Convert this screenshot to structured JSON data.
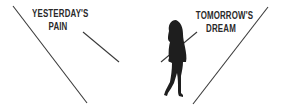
{
  "left_caption": {
    "line1": "YESTERDAY'S",
    "line2": "PAIN"
  },
  "right_caption": {
    "line1": "TOMORROW'S",
    "line2": "DREAM"
  },
  "figure": "walking-woman-silhouette",
  "colors": {
    "ink": "#2a2a2a",
    "background": "#ffffff"
  }
}
